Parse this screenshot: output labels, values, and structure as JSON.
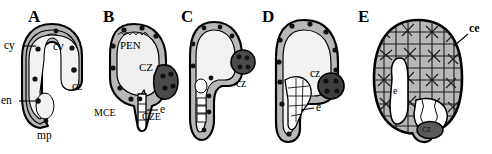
{
  "figure": {
    "caption_present": false,
    "panel_count": 5,
    "background_color": "#ffffff",
    "ink_color": "#000000",
    "tones": {
      "cortex_gray": "#b5b5b5",
      "cytoplasm_light": "#e9e9e9",
      "cavity_white": "#ffffff",
      "chalazal_dark": "#4a4a4a",
      "cell_mass_gray": "#b8b8b8"
    }
  },
  "panels": [
    {
      "id": "A",
      "letter": "A",
      "labels": [
        {
          "key": "cy",
          "text": "cy",
          "leader": true
        },
        {
          "key": "cv",
          "text": "cv",
          "leader": false
        },
        {
          "key": "cz",
          "text": "cz",
          "leader": false
        },
        {
          "key": "en",
          "text": "en",
          "leader": true
        },
        {
          "key": "mp",
          "text": "mp",
          "leader": false
        }
      ]
    },
    {
      "id": "B",
      "letter": "B",
      "labels": [
        {
          "key": "pen",
          "text": "PEN",
          "leader": false
        },
        {
          "key": "cz",
          "text": "CZ",
          "leader": false
        },
        {
          "key": "mce",
          "text": "MCE",
          "leader": false
        },
        {
          "key": "e",
          "text": "e",
          "leader": true
        },
        {
          "key": "cze",
          "text": "CZE",
          "leader": false
        }
      ]
    },
    {
      "id": "C",
      "letter": "C",
      "labels": [
        {
          "key": "cz",
          "text": "cz",
          "leader": false
        }
      ]
    },
    {
      "id": "D",
      "letter": "D",
      "labels": [
        {
          "key": "cz",
          "text": "cz",
          "leader": false
        },
        {
          "key": "e",
          "text": "e",
          "leader": true
        }
      ]
    },
    {
      "id": "E",
      "letter": "E",
      "labels": [
        {
          "key": "ce",
          "text": "ce",
          "leader": true
        },
        {
          "key": "e",
          "text": "e",
          "leader": false
        },
        {
          "key": "cz",
          "text": "cz",
          "leader": false
        }
      ]
    }
  ]
}
